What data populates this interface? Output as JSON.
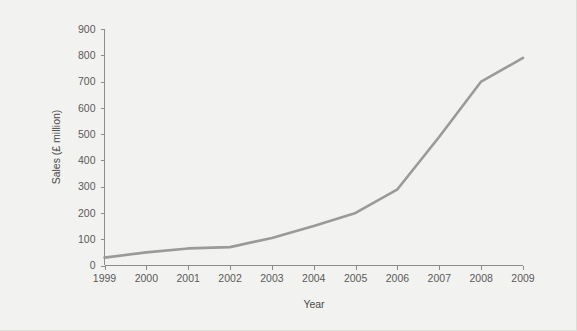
{
  "figure": {
    "background_color": "#f2f2f0",
    "line_color": "#9a9a9a",
    "axis_color": "#8c8c8c"
  },
  "chart_data": {
    "type": "line",
    "title": "",
    "xlabel": "Year",
    "ylabel": "Sales (£ million)",
    "categories": [
      "1999",
      "2000",
      "2001",
      "2002",
      "2003",
      "2004",
      "2005",
      "2006",
      "2007",
      "2008",
      "2009"
    ],
    "x": [
      1999,
      2000,
      2001,
      2002,
      2003,
      2004,
      2005,
      2006,
      2007,
      2008,
      2009
    ],
    "values": [
      30,
      50,
      65,
      70,
      105,
      150,
      200,
      290,
      490,
      700,
      790
    ],
    "xlim": [
      1999,
      2009
    ],
    "ylim": [
      0,
      900
    ],
    "yticks": [
      0,
      100,
      200,
      300,
      400,
      500,
      600,
      700,
      800,
      900
    ],
    "ytick_labels": [
      "0",
      "100",
      "200",
      "300",
      "400",
      "500",
      "600",
      "700",
      "800",
      "900"
    ],
    "xtick_labels": [
      "1999",
      "2000",
      "2001",
      "2002",
      "2003",
      "2004",
      "2005",
      "2006",
      "2007",
      "2008",
      "2009"
    ],
    "grid": false,
    "legend": false,
    "series": [
      {
        "name": "Sales",
        "values": [
          30,
          50,
          65,
          70,
          105,
          150,
          200,
          290,
          490,
          700,
          790
        ]
      }
    ]
  }
}
